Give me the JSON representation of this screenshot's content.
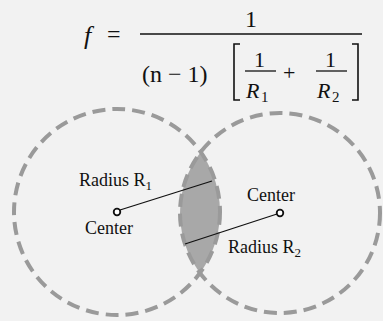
{
  "formula": {
    "lhs": "f",
    "equals": "=",
    "numerator": "1",
    "denominator_prefix": "(n − 1)",
    "term1_num": "1",
    "term1_den": "R",
    "term1_sub": "1",
    "plus": "+",
    "term2_num": "1",
    "term2_den": "R",
    "term2_sub": "2"
  },
  "diagram": {
    "left_label_radius": "Radius R",
    "left_label_radius_sub": "1",
    "left_label_center": "Center",
    "right_label_center": "Center",
    "right_label_radius": "Radius R",
    "right_label_radius_sub": "2"
  },
  "colors": {
    "background": "#f2f2f2",
    "dash": "#9a9a9a",
    "lens_fill": "#a8a8a8",
    "text": "#111111"
  }
}
